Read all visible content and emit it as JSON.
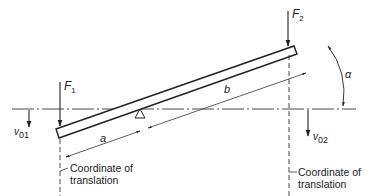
{
  "diagram": {
    "type": "lever-beam-mechanics",
    "colors": {
      "line": "#222222",
      "background": "#ffffff"
    },
    "forces": [
      {
        "id": "F1",
        "symbol": "F",
        "subscript": "1"
      },
      {
        "id": "F2",
        "symbol": "F",
        "subscript": "2"
      }
    ],
    "velocities": [
      {
        "id": "v01",
        "symbol": "v",
        "subscript": "01"
      },
      {
        "id": "v02",
        "symbol": "v",
        "subscript": "02"
      }
    ],
    "dimensions": {
      "a": "a",
      "b": "b"
    },
    "angle": {
      "symbol": "α"
    },
    "captions": {
      "left_line1": "Coordinate of",
      "left_line2": "translation",
      "right_line1": "Coordinate of",
      "right_line2": "translation"
    }
  }
}
